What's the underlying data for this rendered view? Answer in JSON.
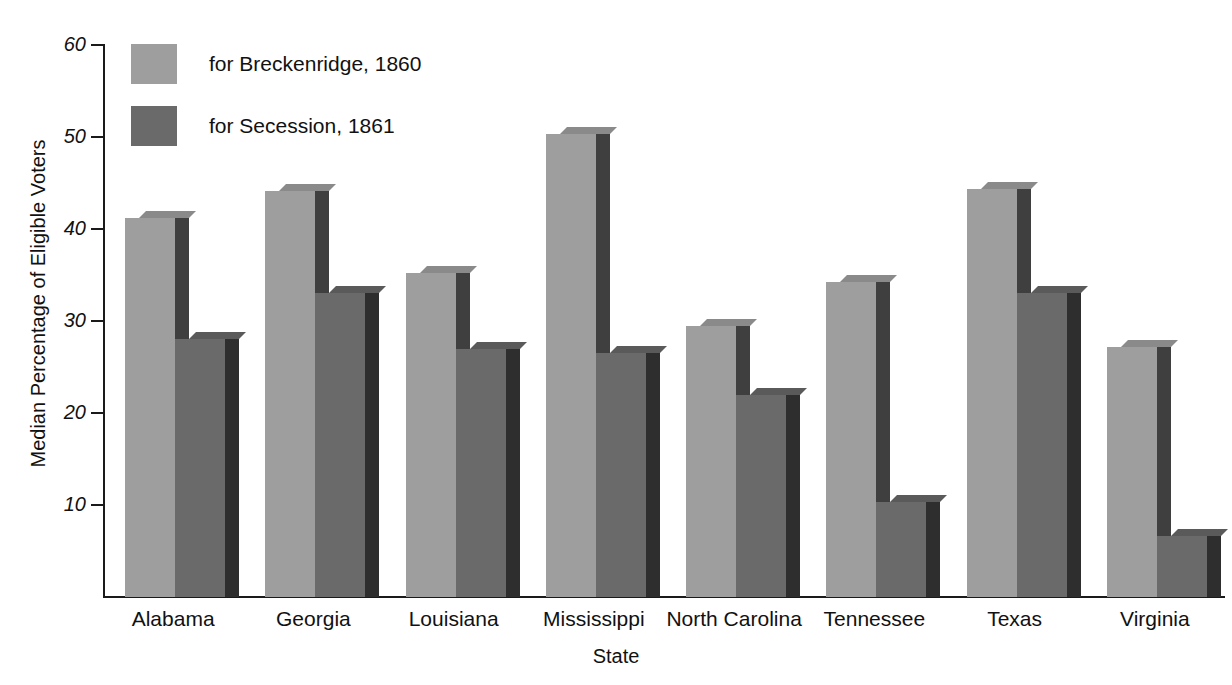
{
  "chart_data": {
    "type": "bar",
    "title": "",
    "xlabel": "State",
    "ylabel": "Median Percentage of Eligible Voters",
    "categories": [
      "Alabama",
      "Georgia",
      "Louisiana",
      "Mississippi",
      "North Carolina",
      "Tennessee",
      "Texas",
      "Virginia"
    ],
    "series": [
      {
        "name": "for Breckenridge, 1860",
        "color": "#9e9e9e",
        "values": [
          41.2,
          44.1,
          35.2,
          50.3,
          29.5,
          34.2,
          44.4,
          27.2
        ]
      },
      {
        "name": "for Secession, 1861",
        "color": "#6a6a6a",
        "values": [
          28.0,
          33.0,
          27.0,
          26.5,
          22.0,
          10.3,
          33.0,
          6.6
        ]
      }
    ],
    "ylim": [
      0,
      60
    ],
    "yticks": [
      10,
      20,
      30,
      40,
      50,
      60
    ],
    "ytick_labels": [
      "10",
      "20",
      "30",
      "40",
      "50",
      "60"
    ],
    "grid": false,
    "legend_position": "top-left",
    "style": "3d-bar"
  },
  "colors": {
    "series1_front": "#9e9e9e",
    "series1_side": "#3f3f3f",
    "series1_top": "#8a8a8a",
    "series2_front": "#6a6a6a",
    "series2_side": "#2e2e2e",
    "series2_top": "#5a5a5a",
    "axis": "#1a1a1a",
    "text": "#111111",
    "background": "#ffffff"
  }
}
